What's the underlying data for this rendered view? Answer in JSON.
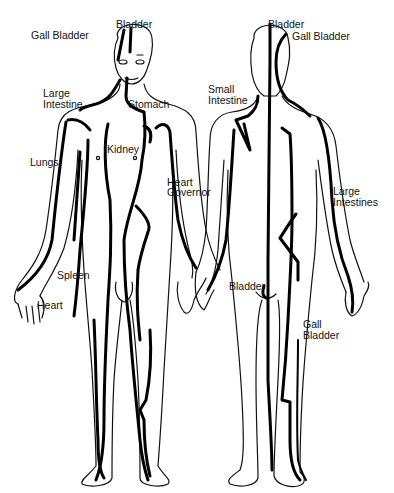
{
  "diagram": {
    "type": "meridian-body-chart",
    "colors": {
      "line": "#000000",
      "background": "#ffffff"
    },
    "front_figure": {
      "labels": [
        {
          "id": "gall-bladder",
          "text": "Gall Bladder"
        },
        {
          "id": "bladder",
          "text": "Bladder"
        },
        {
          "id": "large-intestine-1",
          "text": "Large"
        },
        {
          "id": "large-intestine-2",
          "text": "Intestine"
        },
        {
          "id": "stomach",
          "text": "Stomach"
        },
        {
          "id": "kidney",
          "text": "Kidney"
        },
        {
          "id": "lungs",
          "text": "Lungs"
        },
        {
          "id": "heart-governor-1",
          "text": "Heart"
        },
        {
          "id": "heart-governor-2",
          "text": "Governor"
        },
        {
          "id": "spleen",
          "text": "Spleen"
        },
        {
          "id": "heart",
          "text": "Heart"
        }
      ]
    },
    "back_figure": {
      "labels": [
        {
          "id": "bladder",
          "text": "Bladder"
        },
        {
          "id": "gall-bladder",
          "text": "Gall Bladder"
        },
        {
          "id": "small-intestine-1",
          "text": "Small"
        },
        {
          "id": "small-intestine-2",
          "text": "Intestine"
        },
        {
          "id": "large-intestines-1",
          "text": "Large"
        },
        {
          "id": "large-intestines-2",
          "text": "Intestines"
        },
        {
          "id": "bladder-lower",
          "text": "Bladder"
        },
        {
          "id": "gall-bladder-lower-1",
          "text": "Gall"
        },
        {
          "id": "gall-bladder-lower-2",
          "text": "Bladder"
        }
      ]
    }
  }
}
